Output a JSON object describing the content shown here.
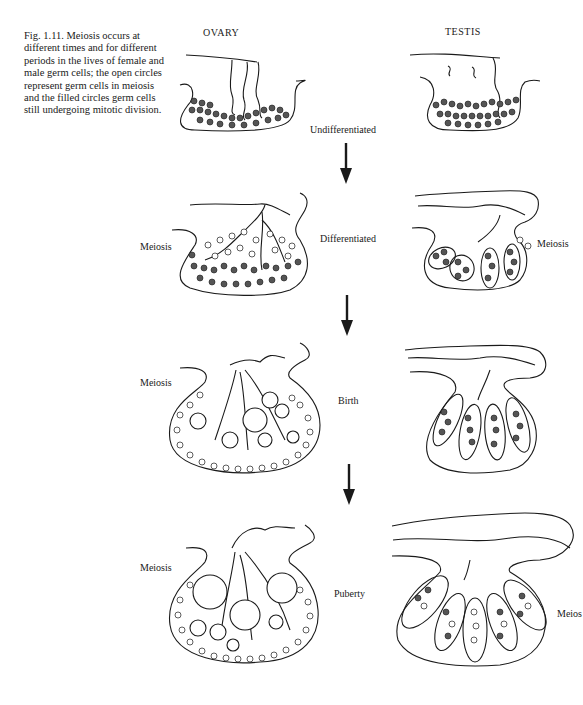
{
  "caption": {
    "text": "Fig. 1.11. Meiosis occurs at different times and for different periods in the lives of female and male germ cells; the open circles represent germ cells in meiosis and the filled circles germ cells still undergoing mitotic division."
  },
  "columns": {
    "left": "OVARY",
    "right": "TESTIS"
  },
  "stages": [
    {
      "label": "Undifferentiated"
    },
    {
      "label": "Differentiated"
    },
    {
      "label": "Birth"
    },
    {
      "label": "Puberty"
    }
  ],
  "side_labels": {
    "ovary_differentiated": "Meiosis",
    "testis_differentiated": "Meiosis",
    "ovary_birth": "Meiosis",
    "ovary_puberty": "Meiosis",
    "testis_puberty": "Meios"
  },
  "colors": {
    "ink": "#1a1a1a",
    "filled_cell": "#555555",
    "background": "#ffffff"
  }
}
